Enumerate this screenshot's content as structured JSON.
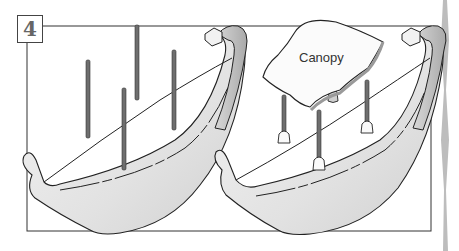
{
  "figure": {
    "step_number": "4",
    "labels": {
      "canopy": "Canopy"
    },
    "panels": [
      {
        "name": "boat-with-posts",
        "description": "Boat hull with four upright poles"
      },
      {
        "name": "boat-with-canopy",
        "description": "Boat hull with canopy mounted on four poles"
      }
    ],
    "colors": {
      "outline": "#222222",
      "hull_fill": "#e9e9e9",
      "hull_shade": "#c9c9c9",
      "pole": "#6e6e6e",
      "side_strip": "#bdbdbd"
    }
  }
}
